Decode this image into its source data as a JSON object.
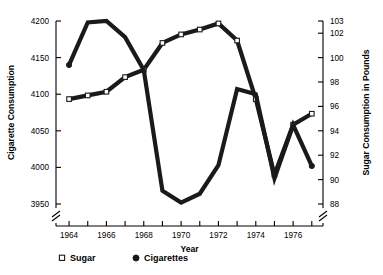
{
  "chart_data": {
    "type": "line",
    "title": "",
    "xlabel": "Year",
    "ylabel": "Cigarette Consumption",
    "ylabel_right": "Sugar Consumption in Pounds",
    "x": [
      1964,
      1965,
      1966,
      1967,
      1968,
      1969,
      1970,
      1971,
      1972,
      1973,
      1974,
      1975,
      1976,
      1977
    ],
    "xlim": [
      1963.3,
      1977.6
    ],
    "xtick_values": [
      1964,
      1965,
      1966,
      1967,
      1968,
      1969,
      1970,
      1971,
      1972,
      1973,
      1974,
      1975,
      1976,
      1977
    ],
    "xtick_labels": [
      "1964",
      "",
      "1966",
      "",
      "1968",
      "",
      "1970",
      "",
      "1972",
      "",
      "1974",
      "",
      "1976",
      ""
    ],
    "ylim": [
      3950,
      4200
    ],
    "ytick_values": [
      3950,
      4000,
      4050,
      4100,
      4150,
      4200
    ],
    "ytick_labels": [
      "3950",
      "4000",
      "4050",
      "4100",
      "4150",
      "4200"
    ],
    "ylim_right": [
      88,
      103
    ],
    "ytick_values_right": [
      88,
      90,
      92,
      94,
      96,
      98,
      100,
      102,
      103
    ],
    "ytick_labels_right": [
      "88",
      "90",
      "92",
      "94",
      "96",
      "98",
      "100",
      "102",
      "103"
    ],
    "axis_break_left": true,
    "axis_break_right": true,
    "grid": false,
    "legend_position": "below-left",
    "series": [
      {
        "name": "Sugar",
        "axis": "right",
        "marker": "open-square",
        "legend_label": "Sugar",
        "legend_marker": "□",
        "values": [
          96.6,
          96.9,
          97.2,
          98.4,
          99.0,
          101.2,
          101.9,
          102.3,
          102.8,
          101.4,
          96.6,
          90.4,
          94.5,
          95.4
        ]
      },
      {
        "name": "Cigarettes",
        "axis": "left",
        "marker": "filled-circle",
        "legend_label": "Cigarettes",
        "legend_marker": "●",
        "values": [
          4140,
          4198,
          4200,
          4178,
          4133,
          3968,
          3952,
          3964,
          4003,
          4107,
          4100,
          3985,
          4058,
          4002
        ]
      }
    ]
  },
  "legend": {
    "items": [
      {
        "marker": "open-square",
        "label": "Sugar"
      },
      {
        "marker": "filled-circle",
        "label": "Cigarettes"
      }
    ]
  },
  "colors": {
    "ink": "#1a1a1a",
    "axis": "#000000",
    "background": "#ffffff"
  }
}
